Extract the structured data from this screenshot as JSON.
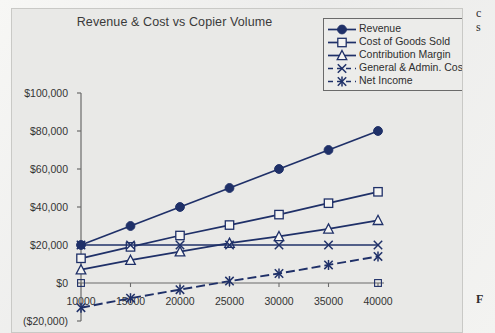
{
  "chart_data": {
    "type": "line",
    "title": "Revenue & Cost vs Copier Volume",
    "xlabel": "",
    "ylabel": "",
    "grid": false,
    "legend_position": "top-right",
    "x": [
      10000,
      15000,
      20000,
      25000,
      30000,
      35000,
      40000
    ],
    "xtick_labels": [
      "10000",
      "15000",
      "20000",
      "25000",
      "30000",
      "35000",
      "40000"
    ],
    "ytick_labels": [
      "$100,000",
      "$80,000",
      "$60,000",
      "$40,000",
      "$20,000",
      "$0",
      "($20,000)"
    ],
    "ytick_values": [
      100000,
      80000,
      60000,
      40000,
      20000,
      0,
      -20000
    ],
    "ylim": [
      -20000,
      100000
    ],
    "xlim": [
      10000,
      40000
    ],
    "series": [
      {
        "name": "Revenue",
        "marker": "filled-circle",
        "color": "#1f3068",
        "values": [
          20000,
          30000,
          40000,
          50000,
          60000,
          70000,
          80000
        ]
      },
      {
        "name": "Cost of Goods Sold",
        "marker": "open-square",
        "color": "#1f3068",
        "values": [
          13000,
          19000,
          25000,
          30500,
          36000,
          42000,
          48000
        ]
      },
      {
        "name": "Contribution Margin",
        "marker": "open-triangle",
        "color": "#1f3068",
        "values": [
          7000,
          12000,
          16500,
          21000,
          24500,
          28500,
          33000
        ]
      },
      {
        "name": "General & Admin. Costs",
        "marker": "x-cross",
        "color": "#1f3068",
        "values": [
          20000,
          20000,
          20000,
          20000,
          20000,
          20000,
          20000
        ]
      },
      {
        "name": "Net Income",
        "marker": "asterisk",
        "color": "#1f3068",
        "values": [
          -13000,
          -8000,
          -3500,
          1000,
          5000,
          9500,
          14000
        ]
      }
    ]
  },
  "legend": {
    "items": [
      {
        "label": "Revenue",
        "marker": "filled-circle"
      },
      {
        "label": "Cost of Goods Sold",
        "marker": "open-square"
      },
      {
        "label": "Contribution Margin",
        "marker": "open-triangle"
      },
      {
        "label": "General & Admin. Costs",
        "marker": "x-cross"
      },
      {
        "label": "Net Income",
        "marker": "asterisk"
      }
    ]
  },
  "page_edge_text": {
    "line1": "c",
    "line2": "s",
    "line3": "F"
  },
  "colors": {
    "series": "#1f3068",
    "axis": "#6b6b6b",
    "plot_background": "#e9e9e7",
    "text": "#333333"
  }
}
